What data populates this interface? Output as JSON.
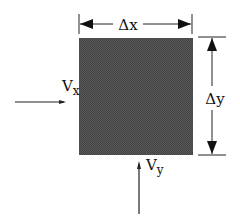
{
  "diagram": {
    "type": "control-volume",
    "element": {
      "fill": "#585858"
    },
    "labels": {
      "dx": "Δx",
      "dy": "Δy",
      "vx_main": "V",
      "vx_sub": "x",
      "vy_main": "V",
      "vy_sub": "y"
    }
  }
}
